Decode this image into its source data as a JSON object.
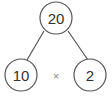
{
  "diagram": {
    "type": "factor-tree",
    "root": {
      "value": "20"
    },
    "children": [
      {
        "value": "10"
      },
      {
        "value": "2"
      }
    ],
    "operator": "×",
    "colors": {
      "stroke": "#555555",
      "text": "#333333",
      "operator": "#888888",
      "background": "#ffffff"
    }
  }
}
